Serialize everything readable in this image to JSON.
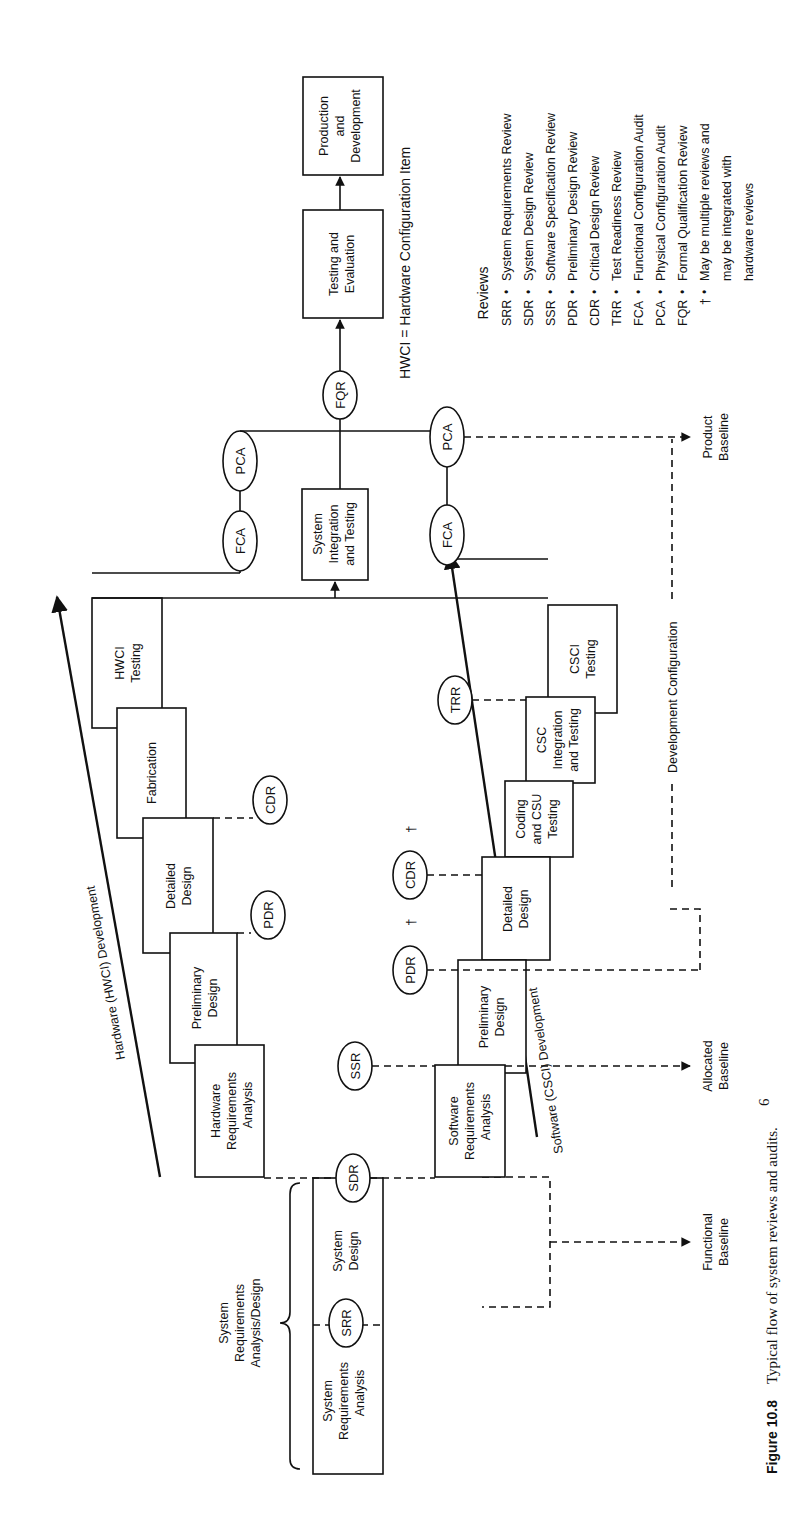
{
  "figure": {
    "number": "Figure 10.8",
    "caption": "Typical flow of system reviews and audits.",
    "caption_superscript": "6",
    "orientation": "rotated 90° counter-clockwise"
  },
  "phases": {
    "system_group_label": [
      "System",
      "Requirements",
      "Analysis/Design"
    ],
    "system_requirements_analysis": [
      "System",
      "Requirements",
      "Analysis"
    ],
    "system_design": [
      "System",
      "Design"
    ]
  },
  "hardware": {
    "arrow_label": "Hardware (HWCI) Development",
    "boxes": [
      {
        "id": "hw-req",
        "lines": [
          "Hardware",
          "Requirements",
          "Analysis"
        ]
      },
      {
        "id": "hw-prelim",
        "lines": [
          "Preliminary",
          "Design"
        ]
      },
      {
        "id": "hw-detailed",
        "lines": [
          "Detailed",
          "Design"
        ]
      },
      {
        "id": "hw-fab",
        "lines": [
          "Fabrication"
        ]
      },
      {
        "id": "hw-test",
        "lines": [
          "HWCI",
          "Testing"
        ]
      }
    ]
  },
  "software": {
    "arrow_label": "Software (CSCI) Development",
    "boxes": [
      {
        "id": "sw-req",
        "lines": [
          "Software",
          "Requirements",
          "Analysis"
        ]
      },
      {
        "id": "sw-prelim",
        "lines": [
          "Preliminary",
          "Design"
        ]
      },
      {
        "id": "sw-detailed",
        "lines": [
          "Detailed",
          "Design"
        ]
      },
      {
        "id": "sw-coding",
        "lines": [
          "Coding",
          "and CSU",
          "Testing"
        ]
      },
      {
        "id": "sw-csc",
        "lines": [
          "CSC",
          "Integration",
          "and Testing"
        ]
      },
      {
        "id": "sw-test",
        "lines": [
          "CSCI",
          "Testing"
        ]
      }
    ]
  },
  "integration": {
    "system_integration": [
      "System",
      "Integration",
      "and Testing"
    ],
    "testing_evaluation": [
      "Testing and",
      "Evaluation"
    ],
    "production": [
      "Production",
      "and",
      "Development"
    ]
  },
  "review_nodes": {
    "srr": "SRR",
    "sdr": "SDR",
    "ssr": "SSR",
    "hw_pdr": "PDR",
    "hw_cdr": "CDR",
    "sw_pdr": "PDR",
    "sw_cdr": "CDR",
    "dagger": "†",
    "trr": "TRR",
    "fca_top": "FCA",
    "pca_top": "PCA",
    "fca_bottom": "FCA",
    "pca_bottom": "PCA",
    "fqr": "FQR"
  },
  "baselines": {
    "functional": [
      "Functional",
      "Baseline"
    ],
    "allocated": [
      "Allocated",
      "Baseline"
    ],
    "product": [
      "Product",
      "Baseline"
    ],
    "development_configuration": "Development Configuration"
  },
  "note_hwci": "HWCI = Hardware Configuration Item",
  "legend": {
    "title": "Reviews",
    "items": [
      {
        "abbr": "SRR",
        "bullet": "•",
        "text": "System Requirements Review"
      },
      {
        "abbr": "SDR",
        "bullet": "•",
        "text": "System Design Review"
      },
      {
        "abbr": "SSR",
        "bullet": "•",
        "text": "Software Specification Review"
      },
      {
        "abbr": "PDR",
        "bullet": "•",
        "text": "Preliminary Design Review"
      },
      {
        "abbr": "CDR",
        "bullet": "•",
        "text": "Critical Design Review"
      },
      {
        "abbr": "TRR",
        "bullet": "•",
        "text": "Test Readiness Review"
      },
      {
        "abbr": "FCA",
        "bullet": "•",
        "text": "Functional Configuration Audit"
      },
      {
        "abbr": "PCA",
        "bullet": "•",
        "text": "Physical Configuration Audit"
      },
      {
        "abbr": "FQR",
        "bullet": "•",
        "text": "Formal Qualification Review"
      }
    ],
    "dagger_note": {
      "abbr": "†",
      "bullet": "•",
      "lines": [
        "May be multiple reviews and",
        "may be integrated with",
        "hardware reviews"
      ]
    }
  }
}
